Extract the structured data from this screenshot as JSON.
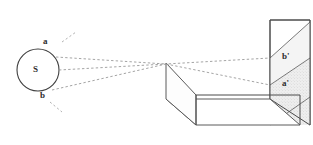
{
  "figure": {
    "background_color": "#ffffff",
    "stroke_color": "#4a4a4a",
    "ray_color": "#9a9a9a",
    "shade_color": "#e9e9e9"
  },
  "labels": {
    "source": "S",
    "object_top": "a",
    "object_bottom": "b",
    "image_top": "b'",
    "image_bottom": "a'"
  },
  "geometry": {
    "source_circle": {
      "cx": 38,
      "cy": 70,
      "r": 21
    },
    "pinhole": {
      "x": 166,
      "y": 64
    },
    "near_panel": "166,63 196,95 196,125 166,99",
    "floor": "166,99 196,125 300,125 270,99",
    "screen": "270,20 310,20 310,125 270,99",
    "band_upper": "270,58 310,22 310,58 270,85",
    "band_lower": "270,85 310,58 310,125 270,125",
    "ray_upper": "56,57 166,64 270,85",
    "ray_lower": "52,90 166,64 270,58",
    "ray_axis": "59,70 166,64",
    "stub_a": "64,40 74,33",
    "stub_b": "52,104 60,111"
  },
  "annotations": {
    "ray_style": "dashed",
    "shaded_region": "lower-band",
    "line_count": 3
  }
}
